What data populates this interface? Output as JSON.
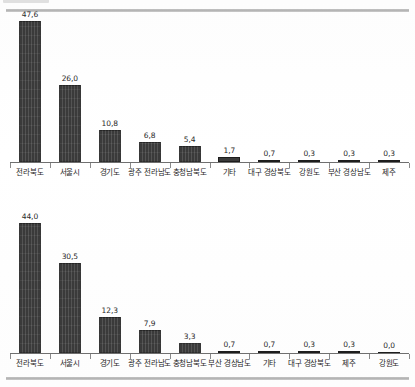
{
  "page": {
    "header_tag_label": "",
    "header_title": ""
  },
  "chart_data": [
    {
      "id": "chart-top",
      "type": "bar",
      "title": "",
      "subtitle": "",
      "xlabel": "",
      "ylabel": "",
      "ylim": [
        0,
        50
      ],
      "grid": false,
      "legend": false,
      "decimal_separator": ",",
      "categories": [
        "전라북도",
        "서울시",
        "경기도",
        "광주 전라남도",
        "충청남북도",
        "기타",
        "대구 경상북도",
        "강원도",
        "부산 경상남도",
        "제주"
      ],
      "values": [
        47.6,
        26.0,
        10.8,
        6.8,
        5.4,
        1.7,
        0.7,
        0.3,
        0.3,
        0.3
      ],
      "value_labels": [
        "47,6",
        "26,0",
        "10,8",
        "6,8",
        "5,4",
        "1,7",
        "0,7",
        "0,3",
        "0,3",
        "0,3"
      ]
    },
    {
      "id": "chart-bottom",
      "type": "bar",
      "title": "",
      "subtitle": "",
      "xlabel": "",
      "ylabel": "",
      "ylim": [
        0,
        50
      ],
      "grid": false,
      "legend": false,
      "decimal_separator": ",",
      "categories": [
        "전라북도",
        "서울시",
        "경기도",
        "광주 전라남도",
        "충청남북도",
        "부산 경상남도",
        "기타",
        "대구 경상북도",
        "제주",
        "강원도"
      ],
      "values": [
        44.0,
        30.5,
        12.3,
        7.9,
        3.3,
        0.7,
        0.7,
        0.3,
        0.3,
        0.0
      ],
      "value_labels": [
        "44,0",
        "30,5",
        "12,3",
        "7,9",
        "3,3",
        "0,7",
        "0,7",
        "0,3",
        "0,3",
        "0,0"
      ]
    }
  ],
  "colors": {
    "bar": "#3a3a3a",
    "axis": "#6f6f6f",
    "rule": "#b0b0b0",
    "text": "#1f1f1f"
  }
}
